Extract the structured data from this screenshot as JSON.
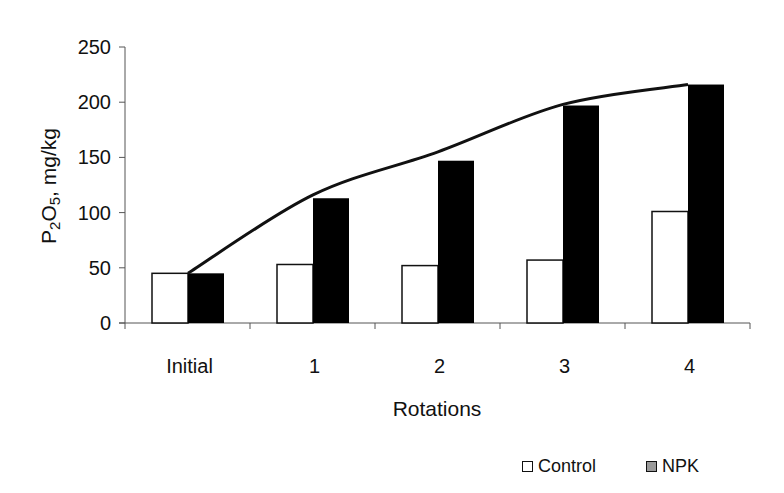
{
  "chart_data": {
    "type": "bar",
    "title": "",
    "xlabel": "Rotations",
    "ylabel_main": "P",
    "ylabel_sub1": "2",
    "ylabel_mid": "O",
    "ylabel_sub2": "5",
    "ylabel_rest": ", mg/kg",
    "ylabel": "P2O5, mg/kg",
    "categories": [
      "Initial",
      "1",
      "2",
      "3",
      "4"
    ],
    "series": [
      {
        "name": "Control",
        "color": "#ffffff",
        "legend_color": "#ffffff",
        "values": [
          45,
          53,
          52,
          57,
          101
        ]
      },
      {
        "name": "NPK",
        "color": "#000000",
        "legend_color": "#9a9a9a",
        "values": [
          45,
          113,
          147,
          197,
          216
        ]
      }
    ],
    "trendline": {
      "description": "smooth curve over NPK bars",
      "values": [
        45,
        116,
        155,
        198,
        216
      ]
    },
    "ylim": [
      0,
      250
    ],
    "yticks": [
      0,
      50,
      100,
      150,
      200,
      250
    ],
    "grid": false,
    "legend_position": "bottom-right"
  }
}
